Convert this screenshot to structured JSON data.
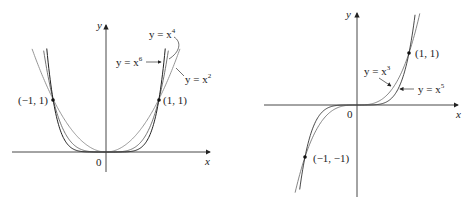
{
  "figures": [
    {
      "id": "even-powers",
      "axis_labels": {
        "x": "x",
        "y": "y",
        "origin": "0"
      },
      "curves": [
        {
          "name": "x2",
          "label": "y = x",
          "exp": "2",
          "color": "#8a8a8a"
        },
        {
          "name": "x4",
          "label": "y = x",
          "exp": "4",
          "color": "#6a6a6a"
        },
        {
          "name": "x6",
          "label": "y = x",
          "exp": "6",
          "color": "#222222"
        }
      ],
      "points": [
        {
          "label": "(−1, 1)",
          "x": -1,
          "y": 1
        },
        {
          "label": "(1, 1)",
          "x": 1,
          "y": 1
        }
      ]
    },
    {
      "id": "odd-powers",
      "axis_labels": {
        "x": "x",
        "y": "y",
        "origin": "0"
      },
      "curves": [
        {
          "name": "x3",
          "label": "y = x",
          "exp": "3",
          "color": "#777777"
        },
        {
          "name": "x5",
          "label": "y = x",
          "exp": "5",
          "color": "#333333"
        }
      ],
      "points": [
        {
          "label": "(1, 1)",
          "x": 1,
          "y": 1
        },
        {
          "label": "(−1, −1)",
          "x": -1,
          "y": -1
        }
      ]
    }
  ],
  "chart_data": [
    {
      "type": "line",
      "title": "",
      "xlabel": "x",
      "ylabel": "y",
      "series": [
        {
          "name": "y = x^2",
          "function": "x^2"
        },
        {
          "name": "y = x^4",
          "function": "x^4"
        },
        {
          "name": "y = x^6",
          "function": "x^6"
        }
      ],
      "annotations": [
        "(-1, 1)",
        "(1, 1)",
        "0"
      ],
      "xlim": [
        -2,
        2
      ],
      "ylim": [
        -0.1,
        2.4
      ],
      "grid": false
    },
    {
      "type": "line",
      "title": "",
      "xlabel": "x",
      "ylabel": "y",
      "series": [
        {
          "name": "y = x^3",
          "function": "x^3"
        },
        {
          "name": "y = x^5",
          "function": "x^5"
        }
      ],
      "annotations": [
        "(1, 1)",
        "(-1, -1)",
        "0"
      ],
      "xlim": [
        -2.6,
        2.4
      ],
      "ylim": [
        -1.9,
        2.0
      ],
      "grid": false
    }
  ]
}
